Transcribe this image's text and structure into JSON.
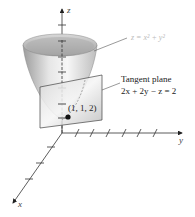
{
  "figure": {
    "axes": {
      "z_label": "z",
      "y_label": "y",
      "x_label": "x"
    },
    "surface": {
      "equation": "z = x² + y²"
    },
    "tangent_plane": {
      "title": "Tangent plane",
      "equation": "2x + 2y − z = 2"
    },
    "point": {
      "label": "(1, 1, 2)"
    },
    "colors": {
      "axis": "#333333",
      "surface_light": "#f2f2f2",
      "surface_dark": "#9a9a9a",
      "plane": "#c8c8c8",
      "surface_label": "#bbbbbb",
      "text": "#222222"
    }
  }
}
